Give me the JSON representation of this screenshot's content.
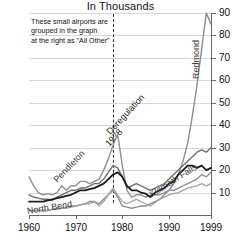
{
  "chart_data": {
    "type": "line",
    "title": "In Thousands",
    "xlabel": "",
    "ylabel": "",
    "xlim": [
      1960,
      1999
    ],
    "ylim": [
      0,
      90
    ],
    "yticks": [
      10,
      20,
      30,
      40,
      50,
      60,
      70,
      80,
      90
    ],
    "xticks": [
      1960,
      1970,
      1980,
      1990,
      1999
    ],
    "xtick_labels": [
      "1960",
      "1970",
      "1980",
      "1990",
      "1999"
    ],
    "grid": true,
    "legend": "inline-labels",
    "annotations": [
      {
        "name": "note-all-other",
        "lines": [
          "These small airports are",
          "grouped in the graph",
          "at the right as \"All Other\""
        ]
      },
      {
        "name": "deregulation-marker",
        "lines": [
          "Deregulation",
          "1978"
        ],
        "x": 1978,
        "style": "dashed-vertical-line"
      }
    ],
    "series": [
      {
        "name": "Redmond",
        "color": "#8c8c8c",
        "width": 1.4,
        "x": [
          1960,
          1961,
          1962,
          1963,
          1964,
          1965,
          1966,
          1967,
          1968,
          1969,
          1970,
          1971,
          1972,
          1973,
          1974,
          1975,
          1976,
          1977,
          1978,
          1979,
          1980,
          1981,
          1982,
          1983,
          1984,
          1985,
          1986,
          1987,
          1988,
          1989,
          1990,
          1991,
          1992,
          1993,
          1994,
          1995,
          1996,
          1997,
          1998,
          1999
        ],
        "y": [
          2,
          2,
          2,
          2,
          2,
          2.5,
          3,
          3,
          3.5,
          4,
          4,
          4.5,
          5,
          6,
          6,
          5,
          7,
          9,
          11,
          8,
          4,
          3.5,
          3,
          3.5,
          4,
          4,
          5,
          6,
          7,
          9,
          11,
          14,
          18,
          24,
          32,
          44,
          58,
          74,
          90,
          85
        ]
      },
      {
        "name": "Pendleton",
        "color": "#909090",
        "width": 1.4,
        "x": [
          1960,
          1961,
          1962,
          1963,
          1964,
          1965,
          1966,
          1967,
          1968,
          1969,
          1970,
          1971,
          1972,
          1973,
          1974,
          1975,
          1976,
          1977,
          1978,
          1979,
          1980,
          1981,
          1982,
          1983,
          1984,
          1985,
          1986,
          1987,
          1988,
          1989,
          1990,
          1991,
          1992,
          1993,
          1994,
          1995,
          1996,
          1997,
          1998,
          1999
        ],
        "y": [
          17,
          13,
          10,
          9,
          9.5,
          9,
          10,
          13,
          11,
          13,
          13,
          15,
          15,
          14,
          15,
          16,
          20,
          25,
          31,
          36,
          22,
          11,
          8,
          9,
          9,
          8,
          8.5,
          9,
          9,
          10,
          11,
          11,
          12,
          13,
          14,
          15,
          16,
          18,
          17,
          19
        ]
      },
      {
        "name": "Klamath Falls",
        "color": "#6f6f6f",
        "width": 1.4,
        "x": [
          1960,
          1961,
          1962,
          1963,
          1964,
          1965,
          1966,
          1967,
          1968,
          1969,
          1970,
          1971,
          1972,
          1973,
          1974,
          1975,
          1976,
          1977,
          1978,
          1979,
          1980,
          1981,
          1982,
          1983,
          1984,
          1985,
          1986,
          1987,
          1988,
          1989,
          1990,
          1991,
          1992,
          1993,
          1994,
          1995,
          1996,
          1997,
          1998,
          1999
        ],
        "y": [
          9,
          8,
          7.5,
          7,
          7,
          6.5,
          8,
          9,
          10,
          11,
          11,
          12,
          12,
          13,
          14,
          14,
          16,
          19,
          22,
          21,
          17,
          12,
          13,
          14,
          13,
          12,
          11,
          12,
          13,
          14,
          16,
          18,
          20,
          22,
          24,
          26,
          28,
          29,
          28,
          30
        ]
      },
      {
        "name": "North Bend",
        "color": "#1b1b1b",
        "width": 1.8,
        "x": [
          1960,
          1961,
          1962,
          1963,
          1964,
          1965,
          1966,
          1967,
          1968,
          1969,
          1970,
          1971,
          1972,
          1973,
          1974,
          1975,
          1976,
          1977,
          1978,
          1979,
          1980,
          1981,
          1982,
          1983,
          1984,
          1985,
          1986,
          1987,
          1988,
          1989,
          1990,
          1991,
          1992,
          1993,
          1994,
          1995,
          1996,
          1997,
          1998,
          1999
        ],
        "y": [
          6,
          6,
          6,
          6,
          6.5,
          7,
          7.5,
          8,
          8.5,
          9,
          10,
          11,
          11,
          11.5,
          12,
          13,
          14,
          16,
          18,
          19,
          17,
          13,
          11,
          11,
          10,
          9.5,
          8,
          10,
          11,
          12,
          14,
          15,
          18,
          20,
          22,
          22,
          21,
          22,
          20,
          21
        ]
      },
      {
        "name": "All Other",
        "color": "#a3a3a3",
        "width": 1.3,
        "x": [
          1960,
          1961,
          1962,
          1963,
          1964,
          1965,
          1966,
          1967,
          1968,
          1969,
          1970,
          1971,
          1972,
          1973,
          1974,
          1975,
          1976,
          1977,
          1978,
          1979,
          1980,
          1981,
          1982,
          1983,
          1984,
          1985,
          1986,
          1987,
          1988,
          1989,
          1990,
          1991,
          1992,
          1993,
          1994,
          1995,
          1996,
          1997,
          1998,
          1999
        ],
        "y": [
          2,
          2,
          2,
          2,
          2,
          2.5,
          2.5,
          3,
          3,
          3.5,
          4,
          4.5,
          5,
          5,
          6,
          4,
          6,
          9,
          12,
          9,
          6,
          5,
          6,
          7,
          6,
          5,
          4,
          5.5,
          7,
          8,
          9,
          9.5,
          10,
          11,
          12,
          12.5,
          13,
          14,
          13,
          14
        ]
      }
    ],
    "series_labels": [
      {
        "name": "Redmond",
        "left": 196,
        "top": 74,
        "rotate": -90
      },
      {
        "name": "Pendleton",
        "left": 55,
        "top": 176,
        "rotate": -46
      },
      {
        "name": "Klamath Falls",
        "left": 150,
        "top": 190,
        "rotate": -32
      },
      {
        "name": "North Bend",
        "left": 27,
        "top": 206,
        "rotate": -9
      }
    ]
  }
}
